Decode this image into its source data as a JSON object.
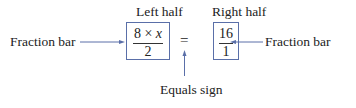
{
  "labels": {
    "left_half": "Left half",
    "right_half": "Right half",
    "fraction_bar_left": "Fraction bar",
    "fraction_bar_right": "Fraction bar",
    "equals_sign": "Equals sign"
  },
  "equation": {
    "left": {
      "numerator_a": "8",
      "operator": "×",
      "numerator_var": "x",
      "denominator": "2"
    },
    "equals": "=",
    "right": {
      "numerator": "16",
      "denominator": "1"
    }
  },
  "colors": {
    "arrow": "#5a6fa8",
    "box_border": "#5a6fa8",
    "text": "#222222"
  }
}
